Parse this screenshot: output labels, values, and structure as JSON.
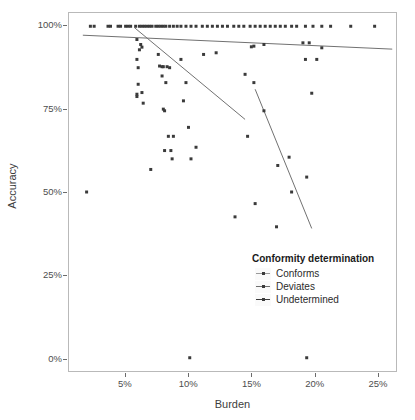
{
  "chart_data": {
    "type": "scatter",
    "title": "",
    "xlabel": "Burden",
    "ylabel": "Accuracy",
    "xlim": [
      0.5,
      26.5
    ],
    "ylim": [
      -4,
      104
    ],
    "xticks": [
      5,
      10,
      15,
      20,
      25
    ],
    "xtick_labels": [
      "5%",
      "10%",
      "15%",
      "20%",
      "25%"
    ],
    "yticks": [
      0,
      25,
      50,
      75,
      100
    ],
    "ytick_labels": [
      "0%",
      "25%",
      "50%",
      "75%",
      "100%"
    ],
    "grid": false,
    "legend": {
      "title": "Conformity determination",
      "position": "inside-bottom-right",
      "entries": [
        {
          "label": "Conforms",
          "color": "#9a9a9a"
        },
        {
          "label": "Deviates",
          "color": "#6f6f6f"
        },
        {
          "label": "Undetermined",
          "color": "#3a3a3a"
        }
      ]
    },
    "point_color": "#3a3a3a",
    "point_size": 3,
    "series": [
      {
        "name": "Conforms",
        "color": "#9a9a9a",
        "trend_line": {
          "x": [
            1.6,
            26.2
          ],
          "y": [
            97.3,
            93.1
          ]
        },
        "points": [
          [
            2.2,
            100
          ],
          [
            2.5,
            100
          ],
          [
            3.6,
            100
          ],
          [
            3.8,
            100
          ],
          [
            4.4,
            100
          ],
          [
            4.6,
            100
          ],
          [
            5.0,
            100
          ],
          [
            5.2,
            100
          ],
          [
            5.4,
            100
          ],
          [
            5.8,
            100
          ],
          [
            6.1,
            100
          ],
          [
            6.3,
            100
          ],
          [
            6.5,
            100
          ],
          [
            6.7,
            100
          ],
          [
            6.9,
            100
          ],
          [
            7.1,
            100
          ],
          [
            7.4,
            100
          ],
          [
            7.6,
            100
          ],
          [
            7.8,
            100
          ],
          [
            8.0,
            100
          ],
          [
            8.2,
            100
          ],
          [
            8.5,
            100
          ],
          [
            8.8,
            100
          ],
          [
            9.1,
            100
          ],
          [
            9.4,
            100
          ],
          [
            9.8,
            100
          ],
          [
            10.2,
            100
          ],
          [
            10.6,
            100
          ],
          [
            11.1,
            100
          ],
          [
            11.5,
            100
          ],
          [
            11.9,
            100
          ],
          [
            12.3,
            100
          ],
          [
            12.7,
            100
          ],
          [
            13.1,
            100
          ],
          [
            13.6,
            100
          ],
          [
            14.0,
            100
          ],
          [
            14.4,
            100
          ],
          [
            14.9,
            100
          ],
          [
            15.3,
            100
          ],
          [
            15.7,
            100
          ],
          [
            16.1,
            100
          ],
          [
            16.5,
            100
          ],
          [
            16.9,
            100
          ],
          [
            17.3,
            100
          ],
          [
            17.7,
            100
          ],
          [
            18.2,
            100
          ],
          [
            18.6,
            100
          ],
          [
            19.3,
            100
          ],
          [
            19.9,
            100
          ],
          [
            20.6,
            100
          ],
          [
            21.3,
            100
          ],
          [
            22.9,
            100
          ],
          [
            24.8,
            100
          ]
        ]
      },
      {
        "name": "Deviates",
        "color": "#6f6f6f",
        "trend_line": {
          "x": [
            5.7,
            14.5
          ],
          "y": [
            99.6,
            71.9
          ]
        },
        "points": [
          [
            5.9,
            96.0
          ],
          [
            6.1,
            92.9
          ],
          [
            6.2,
            94.5
          ],
          [
            6.3,
            93.7
          ],
          [
            5.9,
            90.0
          ],
          [
            6.0,
            87.5
          ],
          [
            6.4,
            76.8
          ],
          [
            5.9,
            78.8
          ],
          [
            5.9,
            79.5
          ],
          [
            6.0,
            82.5
          ],
          [
            6.3,
            80.0
          ],
          [
            7.0,
            56.8
          ],
          [
            7.7,
            88.0
          ],
          [
            7.9,
            87.8
          ],
          [
            8.0,
            87.8
          ],
          [
            8.3,
            87.8
          ],
          [
            8.5,
            87.5
          ],
          [
            7.6,
            91.5
          ],
          [
            7.9,
            85.0
          ],
          [
            8.2,
            83.0
          ],
          [
            8.0,
            75.0
          ],
          [
            8.1,
            74.5
          ],
          [
            8.4,
            66.8
          ],
          [
            8.8,
            66.8
          ],
          [
            8.1,
            62.5
          ],
          [
            8.6,
            62.5
          ],
          [
            8.7,
            60.0
          ],
          [
            9.4,
            90.0
          ],
          [
            9.6,
            77.5
          ],
          [
            9.8,
            83.0
          ],
          [
            10.0,
            69.5
          ],
          [
            10.2,
            60.0
          ],
          [
            10.6,
            63.5
          ],
          [
            11.2,
            91.5
          ],
          [
            12.2,
            92.0
          ],
          [
            10.1,
            0
          ]
        ]
      },
      {
        "name": "Undetermined",
        "color": "#3a3a3a",
        "trend_line": {
          "x": [
            15.3,
            19.8
          ],
          "y": [
            81.0,
            39.0
          ]
        },
        "points": [
          [
            1.9,
            50.0
          ],
          [
            13.7,
            42.5
          ],
          [
            14.5,
            85.5
          ],
          [
            14.7,
            66.8
          ],
          [
            15.0,
            93.8
          ],
          [
            15.2,
            94.0
          ],
          [
            15.2,
            83.0
          ],
          [
            15.3,
            46.5
          ],
          [
            16.0,
            94.5
          ],
          [
            16.0,
            74.5
          ],
          [
            17.0,
            39.5
          ],
          [
            17.1,
            58.0
          ],
          [
            18.0,
            60.5
          ],
          [
            18.2,
            50.0
          ],
          [
            19.1,
            95.0
          ],
          [
            19.3,
            90.0
          ],
          [
            19.4,
            54.5
          ],
          [
            19.4,
            0
          ],
          [
            19.6,
            95.0
          ],
          [
            19.8,
            79.8
          ],
          [
            20.2,
            90.0
          ],
          [
            20.6,
            93.5
          ]
        ]
      }
    ]
  }
}
